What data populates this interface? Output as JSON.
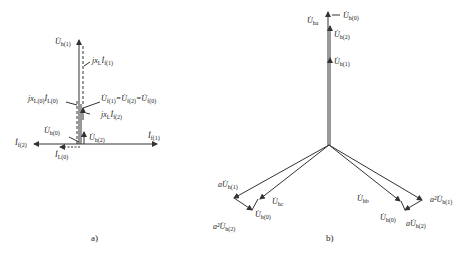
{
  "panel_a": {
    "caption": "a)",
    "labels": {
      "uh1": {
        "main": "U̇",
        "sub": "h(1)"
      },
      "jxl_if1": {
        "main": "jx",
        "sub1": "L",
        "mid": "İ",
        "sub2": "f(1)"
      },
      "jxl0_il0": {
        "main": "jx",
        "sub1": "L(0)",
        "mid": "İ",
        "sub2": "L(0)"
      },
      "uf_eq": {
        "text": "U̇f(1)=U̇f(2)=U̇f(0)",
        "parts": [
          {
            "main": "U̇",
            "sub": "f(1)"
          },
          {
            "main": "=U̇",
            "sub": "f(2)"
          },
          {
            "main": "=U̇",
            "sub": "f(0)"
          }
        ]
      },
      "jxl_if2": {
        "main": "jx",
        "sub1": "L",
        "mid": "İ",
        "sub2": "f(2)"
      },
      "uh0": {
        "main": "U̇",
        "sub": "h(0)"
      },
      "uh2": {
        "main": "U̇",
        "sub": "h(2)"
      },
      "if2": {
        "main": "İ",
        "sub": "f(2)"
      },
      "if1": {
        "main": "İ",
        "sub": "f(1)"
      },
      "il0": {
        "main": "İ",
        "sub": "L(0)"
      }
    }
  },
  "panel_b": {
    "caption": "b)",
    "labels": {
      "uha": {
        "main": "U̇",
        "sub": "ha"
      },
      "uh0_top": {
        "main": "U̇",
        "sub": "h(0)"
      },
      "uh2_top": {
        "main": "U̇",
        "sub": "h(2)"
      },
      "uh1_top": {
        "main": "U̇",
        "sub": "h(1)"
      },
      "a_uh1_left": {
        "pre": "a",
        "main": "U̇",
        "sub": "h(1)"
      },
      "uhc": {
        "main": "U̇",
        "sub": "hc"
      },
      "uh0_left": {
        "main": "U̇",
        "sub": "h(0)"
      },
      "a2_uh2_left": {
        "pre": "a²",
        "main": "U̇",
        "sub": "h(2)"
      },
      "uhb": {
        "main": "U̇",
        "sub": "hb"
      },
      "a2_uh1_right": {
        "pre": "a²",
        "main": "U̇",
        "sub": "h(1)"
      },
      "uh0_right": {
        "main": "U̇",
        "sub": "h(0)"
      },
      "a_uh2_right": {
        "pre": "a",
        "main": "U̇",
        "sub": "h(2)"
      }
    }
  },
  "colors": {
    "line": "#333333",
    "background": "#ffffff"
  }
}
